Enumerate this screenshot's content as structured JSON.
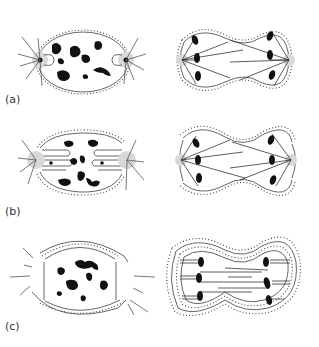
{
  "figure": {
    "panels": [
      {
        "label": "(a)",
        "stages": [
          "prophase",
          "anaphase"
        ],
        "envelope": "closed (intact, single membrane)"
      },
      {
        "label": "(b)",
        "stages": [
          "prophase",
          "anaphase"
        ],
        "envelope": "semi-closed (fenestrated at poles)"
      },
      {
        "label": "(c)",
        "stages": [
          "prophase",
          "anaphase"
        ],
        "envelope": "open (dispersed into ER-like cisternae)"
      }
    ]
  }
}
